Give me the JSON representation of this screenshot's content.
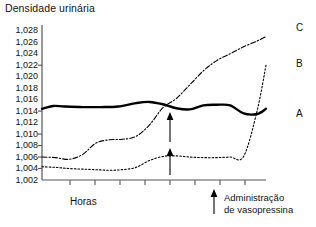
{
  "chart_data": {
    "type": "line",
    "title": "Densidade urinária",
    "xlabel": "Horas",
    "ylabel": "",
    "ylim": [
      1002,
      1029
    ],
    "yticks": [
      1028,
      1026,
      1024,
      1022,
      1020,
      1018,
      1016,
      1014,
      1012,
      1010,
      1008,
      1006,
      1004,
      1002
    ],
    "ytick_labels": [
      "1,028",
      "1,026",
      "1,024",
      "1,022",
      "1,020",
      "1,018",
      "1,016",
      "1,014",
      "1,012",
      "1,010",
      "1,008",
      "1,006",
      "1,004",
      "1,002"
    ],
    "grid": false,
    "xticks_count": 8,
    "xtick_labels": [],
    "legend_position": "right-inline",
    "annotations": [
      {
        "name": "vasopressin-administration",
        "text_line1": "Administração",
        "text_line2": "de vasopressina",
        "arrow": "up"
      },
      {
        "name": "in-plot-arrow-upper",
        "text": "",
        "arrow": "up"
      },
      {
        "name": "in-plot-arrow-lower",
        "text": "",
        "arrow": "up"
      }
    ],
    "series": [
      {
        "name": "A",
        "label": "A",
        "style": "solid-thick",
        "color": "#000000",
        "x": [
          0,
          5,
          10,
          18,
          26,
          34,
          42,
          48,
          54,
          60,
          66,
          72,
          78,
          84,
          90,
          96,
          100
        ],
        "values": [
          1014.4,
          1014.9,
          1014.8,
          1014.7,
          1014.7,
          1014.8,
          1015.4,
          1015.6,
          1015.2,
          1014.5,
          1014.3,
          1015.0,
          1015.1,
          1015.0,
          1013.6,
          1013.5,
          1014.4
        ]
      },
      {
        "name": "B",
        "label": "B",
        "style": "dotted",
        "color": "#000000",
        "x": [
          0,
          6,
          12,
          18,
          24,
          30,
          36,
          42,
          48,
          54,
          60,
          66,
          72,
          78,
          84,
          90,
          96,
          100
        ],
        "values": [
          1004.3,
          1004.2,
          1004.0,
          1003.9,
          1003.8,
          1003.7,
          1003.8,
          1004.2,
          1005.4,
          1006.1,
          1006.2,
          1006.0,
          1005.9,
          1005.9,
          1006.0,
          1006.1,
          1014.0,
          1022.0
        ]
      },
      {
        "name": "C",
        "label": "C",
        "style": "dash-dot",
        "color": "#000000",
        "x": [
          0,
          6,
          12,
          18,
          24,
          30,
          36,
          42,
          48,
          54,
          60,
          66,
          72,
          78,
          84,
          90,
          96,
          100
        ],
        "values": [
          1006.0,
          1005.9,
          1005.6,
          1006.4,
          1008.4,
          1009.0,
          1009.1,
          1009.6,
          1011.6,
          1014.6,
          1016.2,
          1018.6,
          1021.0,
          1022.8,
          1024.0,
          1025.2,
          1026.2,
          1027.0
        ]
      }
    ]
  }
}
